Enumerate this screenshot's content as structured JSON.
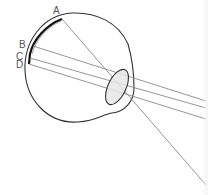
{
  "diagram": {
    "labels": {
      "a": "A",
      "b": "B",
      "c": "C",
      "d": "D"
    },
    "colors": {
      "outline": "#333333",
      "retina": "#111111",
      "rays": "#8a8a8a",
      "lens_fill": "#e6e6e6",
      "label": "#555555"
    },
    "rays": [
      {
        "name": "ray-a",
        "from": [
          62,
          19
        ],
        "to": [
          206,
          185
        ]
      },
      {
        "name": "ray-b",
        "from": [
          33,
          46
        ],
        "to": [
          206,
          101
        ]
      },
      {
        "name": "ray-c",
        "from": [
          30,
          58
        ],
        "to": [
          206,
          108
        ]
      },
      {
        "name": "ray-d",
        "from": [
          29,
          64
        ],
        "to": [
          206,
          119
        ]
      }
    ]
  }
}
